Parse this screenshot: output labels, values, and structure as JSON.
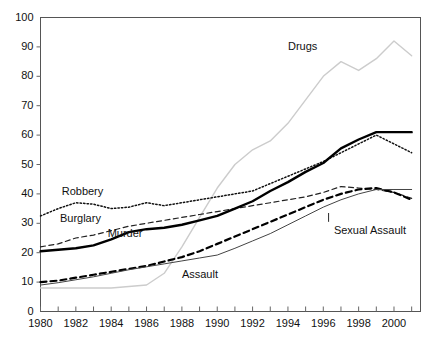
{
  "figure": {
    "background": "#ffffff",
    "plot_frame_color": "#555555",
    "width": 433,
    "height": 337
  },
  "chart_data": {
    "type": "line",
    "title": "",
    "xlabel": "",
    "ylabel": "",
    "xlim": [
      1980,
      2001.5
    ],
    "ylim": [
      0,
      100
    ],
    "ytick_step": 10,
    "xtick_step": 1,
    "xtick_label_step": 2,
    "grid": false,
    "legend": "inline-labels",
    "ytick_labels": [
      "0",
      "10",
      "20",
      "30",
      "40",
      "50",
      "60",
      "70",
      "80",
      "90",
      "100"
    ],
    "ytick_values": [
      0,
      10,
      20,
      30,
      40,
      50,
      60,
      70,
      80,
      90,
      100
    ],
    "xtick_labels": [
      "1980",
      "1982",
      "1984",
      "1986",
      "1988",
      "1990",
      "1992",
      "1994",
      "1996",
      "1998",
      "2000"
    ],
    "xtick_values": [
      1980,
      1982,
      1984,
      1986,
      1988,
      1990,
      1992,
      1994,
      1996,
      1998,
      2000
    ],
    "x": [
      1980,
      1981,
      1982,
      1983,
      1984,
      1985,
      1986,
      1987,
      1988,
      1989,
      1990,
      1991,
      1992,
      1993,
      1994,
      1995,
      1996,
      1997,
      1998,
      1999,
      2000,
      2001
    ],
    "series": [
      {
        "name": "Drugs",
        "style": "solid",
        "color": "#cccccc",
        "width": 1.4,
        "values": [
          8,
          8,
          8,
          8,
          8,
          8.5,
          9,
          13,
          22,
          32,
          42,
          50,
          55,
          58,
          64,
          72,
          80,
          85,
          82,
          86,
          92,
          87
        ],
        "label_x": 1994.0,
        "label_y": 90
      },
      {
        "name": "Robbery",
        "style": "dotted",
        "color": "#111111",
        "width": 1.5,
        "values": [
          32.5,
          35,
          37,
          36.5,
          35,
          35.5,
          37,
          36,
          37,
          38,
          39,
          40,
          41,
          43.5,
          46,
          48.5,
          51,
          54,
          57,
          60,
          57,
          54
        ],
        "label_x": 1981.2,
        "label_y": 40.5
      },
      {
        "name": "Burglary",
        "style": "dashed",
        "color": "#222222",
        "width": 1.2,
        "values": [
          22,
          23,
          25,
          26,
          27.5,
          29,
          30,
          31,
          32,
          33,
          34,
          35,
          36,
          37,
          38,
          39,
          40.5,
          42.5,
          42,
          41.5,
          40.5,
          38.5
        ],
        "label_x": 1981.1,
        "label_y": 31.5
      },
      {
        "name": "Murder",
        "style": "solid",
        "color": "#000000",
        "width": 2.4,
        "values": [
          20.5,
          21,
          21.5,
          22.5,
          24.5,
          27,
          28,
          28.5,
          29.5,
          31,
          32.5,
          35,
          37.5,
          41,
          44,
          47.5,
          50.5,
          55.5,
          58.5,
          61,
          61,
          61
        ],
        "label_x": 1983.8,
        "label_y": 26.5
      },
      {
        "name": "Sexual Assault",
        "style": "thick-dashed",
        "color": "#000000",
        "width": 2.2,
        "values": [
          10,
          10.5,
          11.5,
          12.5,
          13.5,
          14.5,
          15.5,
          17,
          18.5,
          20.5,
          23,
          25.5,
          28,
          30.5,
          33,
          35.5,
          38,
          40,
          41.5,
          42,
          40.5,
          38
        ],
        "label_x": 1996.6,
        "label_y": 27.5,
        "leader_from": [
          1996.3,
          33.5
        ],
        "leader_to": [
          1996.3,
          30.5
        ]
      },
      {
        "name": "Assault",
        "style": "thin-solid",
        "color": "#444444",
        "width": 1.0,
        "values": [
          9,
          9.8,
          10.8,
          11.8,
          13,
          14.2,
          15.2,
          16.2,
          17.2,
          18.2,
          19.2,
          21.5,
          24,
          26.5,
          29.5,
          32.5,
          35.5,
          38,
          40,
          41.5,
          41.5,
          41.5
        ],
        "label_x": 1988.0,
        "label_y": 12.5
      }
    ]
  }
}
